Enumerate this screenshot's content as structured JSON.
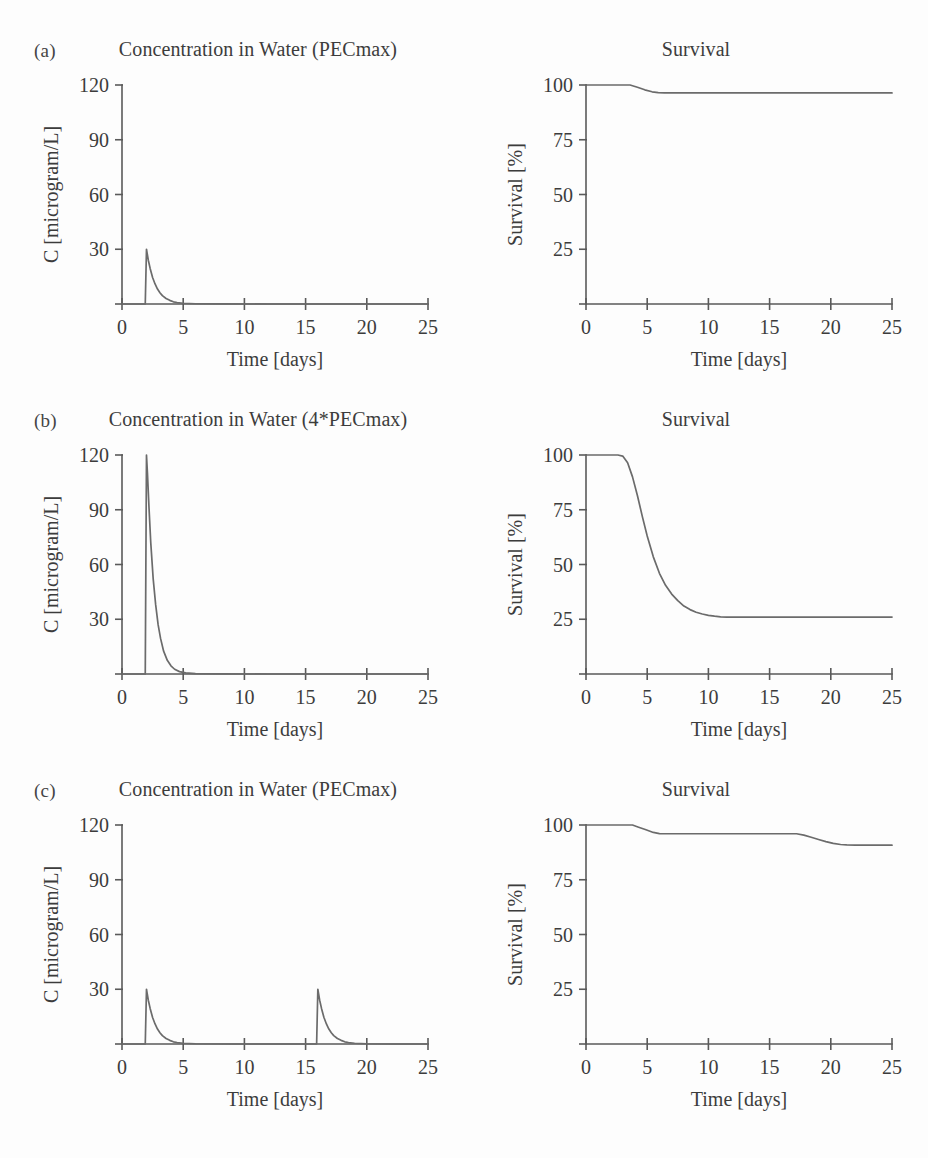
{
  "figure": {
    "background": "#fdfdfd",
    "curve_color": "#6b6b6b",
    "axis_color": "#5a5a5a",
    "text_color": "#3c3c3c"
  },
  "panels": [
    {
      "tag": "(a)",
      "left": {
        "title": "Concentration in Water (PECmax)",
        "xlabel": "Time [days]",
        "ylabel": "C [microgram/L]"
      },
      "right": {
        "title": "Survival",
        "xlabel": "Time [days]",
        "ylabel": "Survival [%]"
      }
    },
    {
      "tag": "(b)",
      "left": {
        "title": "Concentration in Water (4*PECmax)",
        "xlabel": "Time [days]",
        "ylabel": "C [microgram/L]"
      },
      "right": {
        "title": "Survival",
        "xlabel": "Time [days]",
        "ylabel": "Survival [%]"
      }
    },
    {
      "tag": "(c)",
      "left": {
        "title": "Concentration in Water (PECmax)",
        "xlabel": "Time [days]",
        "ylabel": "C [microgram/L]"
      },
      "right": {
        "title": "Survival",
        "xlabel": "Time [days]",
        "ylabel": "Survival [%]"
      }
    }
  ],
  "chart_data": [
    {
      "id": "a-concentration",
      "panel": "(a)",
      "type": "line",
      "title": "Concentration in Water (PECmax)",
      "xlabel": "Time [days]",
      "ylabel": "C [microgram/L]",
      "xlim": [
        0,
        25
      ],
      "ylim": [
        0,
        120
      ],
      "xticks": [
        0,
        5,
        10,
        15,
        20,
        25
      ],
      "yticks": [
        0,
        30,
        60,
        90,
        120
      ],
      "ytick_labels": [
        "",
        "30",
        "60",
        "90",
        "120"
      ],
      "grid": false,
      "legend": "none",
      "series": [
        {
          "name": "PECmax pulse",
          "x": [
            0,
            1.0,
            1.9,
            2.0,
            2.05,
            2.15,
            2.3,
            2.5,
            2.7,
            2.9,
            3.1,
            3.3,
            3.6,
            3.9,
            4.2,
            4.5,
            5.0,
            6.0,
            8.0,
            12.0,
            18.0,
            25.0
          ],
          "y": [
            0,
            0,
            0,
            30.0,
            28.0,
            24.0,
            19.5,
            14.5,
            11.0,
            8.2,
            6.2,
            4.6,
            3.0,
            2.0,
            1.2,
            0.8,
            0.4,
            0.15,
            0.05,
            0.0,
            0.0,
            0.0
          ]
        }
      ]
    },
    {
      "id": "a-survival",
      "panel": "(a)",
      "type": "line",
      "title": "Survival",
      "xlabel": "Time [days]",
      "ylabel": "Survival [%]",
      "xlim": [
        0,
        25
      ],
      "ylim": [
        0,
        100
      ],
      "xticks": [
        0,
        5,
        10,
        15,
        20,
        25
      ],
      "yticks": [
        0,
        25,
        50,
        75,
        100
      ],
      "ytick_labels": [
        "",
        "25",
        "50",
        "75",
        "100"
      ],
      "grid": false,
      "legend": "none",
      "series": [
        {
          "name": "Survival",
          "x": [
            0,
            2.0,
            3.6,
            4.2,
            4.8,
            5.4,
            5.9,
            6.4,
            8.0,
            12.0,
            18.0,
            25.0
          ],
          "y": [
            100,
            100,
            100,
            99.0,
            97.8,
            96.9,
            96.5,
            96.4,
            96.4,
            96.4,
            96.4,
            96.4
          ]
        }
      ]
    },
    {
      "id": "b-concentration",
      "panel": "(b)",
      "type": "line",
      "title": "Concentration in Water (4*PECmax)",
      "xlabel": "Time [days]",
      "ylabel": "C [microgram/L]",
      "xlim": [
        0,
        25
      ],
      "ylim": [
        0,
        120
      ],
      "xticks": [
        0,
        5,
        10,
        15,
        20,
        25
      ],
      "yticks": [
        0,
        30,
        60,
        90,
        120
      ],
      "ytick_labels": [
        "",
        "30",
        "60",
        "90",
        "120"
      ],
      "grid": false,
      "legend": "none",
      "series": [
        {
          "name": "4*PECmax pulse",
          "x": [
            0,
            1.0,
            1.9,
            2.0,
            2.08,
            2.2,
            2.35,
            2.55,
            2.75,
            2.95,
            3.15,
            3.4,
            3.7,
            4.0,
            4.3,
            4.7,
            5.2,
            6.0,
            8.0,
            12.0,
            18.0,
            25.0
          ],
          "y": [
            0,
            0,
            0,
            120.0,
            110.0,
            92.0,
            72.0,
            52.0,
            38.0,
            27.0,
            19.5,
            12.5,
            7.5,
            4.5,
            2.6,
            1.3,
            0.6,
            0.2,
            0.05,
            0.0,
            0.0,
            0.0
          ]
        }
      ]
    },
    {
      "id": "b-survival",
      "panel": "(b)",
      "type": "line",
      "title": "Survival",
      "xlabel": "Time [days]",
      "ylabel": "Survival [%]",
      "xlim": [
        0,
        25
      ],
      "ylim": [
        0,
        100
      ],
      "xticks": [
        0,
        5,
        10,
        15,
        20,
        25
      ],
      "yticks": [
        0,
        25,
        50,
        75,
        100
      ],
      "ytick_labels": [
        "",
        "25",
        "50",
        "75",
        "100"
      ],
      "grid": false,
      "legend": "none",
      "series": [
        {
          "name": "Survival",
          "x": [
            0,
            1.5,
            2.6,
            3.0,
            3.4,
            3.8,
            4.2,
            4.6,
            5.0,
            5.5,
            6.0,
            6.5,
            7.0,
            7.5,
            8.0,
            8.5,
            9.0,
            9.5,
            10.0,
            10.5,
            11.0,
            11.5,
            12.5,
            15.0,
            20.0,
            25.0
          ],
          "y": [
            100,
            100,
            100,
            99.5,
            96.5,
            90.0,
            81.5,
            72.0,
            63.0,
            53.5,
            46.0,
            40.5,
            36.5,
            33.5,
            31.0,
            29.4,
            28.2,
            27.4,
            26.8,
            26.4,
            26.1,
            26.0,
            26.0,
            26.0,
            26.0,
            26.0
          ]
        }
      ]
    },
    {
      "id": "c-concentration",
      "panel": "(c)",
      "type": "line",
      "title": "Concentration in Water (PECmax)",
      "xlabel": "Time [days]",
      "ylabel": "C [microgram/L]",
      "xlim": [
        0,
        25
      ],
      "ylim": [
        0,
        120
      ],
      "xticks": [
        0,
        5,
        10,
        15,
        20,
        25
      ],
      "yticks": [
        0,
        30,
        60,
        90,
        120
      ],
      "ytick_labels": [
        "",
        "30",
        "60",
        "90",
        "120"
      ],
      "grid": false,
      "legend": "none",
      "series": [
        {
          "name": "PECmax pulse 1 and 2",
          "x": [
            0,
            1.0,
            1.9,
            2.0,
            2.05,
            2.15,
            2.3,
            2.5,
            2.7,
            2.9,
            3.1,
            3.3,
            3.6,
            3.9,
            4.2,
            4.5,
            5.0,
            6.0,
            9.0,
            13.0,
            15.9,
            16.0,
            16.05,
            16.15,
            16.3,
            16.5,
            16.7,
            16.9,
            17.1,
            17.3,
            17.6,
            17.9,
            18.2,
            18.5,
            19.0,
            20.0,
            22.0,
            25.0
          ],
          "y": [
            0,
            0,
            0,
            30.0,
            28.0,
            24.0,
            19.5,
            14.5,
            11.0,
            8.2,
            6.2,
            4.6,
            3.0,
            2.0,
            1.2,
            0.8,
            0.4,
            0.15,
            0.0,
            0.0,
            0.0,
            30.0,
            28.0,
            24.0,
            19.5,
            14.5,
            11.0,
            8.2,
            6.2,
            4.6,
            3.0,
            2.0,
            1.2,
            0.8,
            0.4,
            0.15,
            0.0,
            0.0
          ]
        }
      ]
    },
    {
      "id": "c-survival",
      "panel": "(c)",
      "type": "line",
      "title": "Survival",
      "xlabel": "Time [days]",
      "ylabel": "Survival [%]",
      "xlim": [
        0,
        25
      ],
      "ylim": [
        0,
        100
      ],
      "xticks": [
        0,
        5,
        10,
        15,
        20,
        25
      ],
      "yticks": [
        0,
        25,
        50,
        75,
        100
      ],
      "ytick_labels": [
        "",
        "25",
        "50",
        "75",
        "100"
      ],
      "grid": false,
      "legend": "none",
      "series": [
        {
          "name": "Survival",
          "x": [
            0,
            2.0,
            3.8,
            4.3,
            4.9,
            5.5,
            6.0,
            6.5,
            10.0,
            14.0,
            17.2,
            17.8,
            18.4,
            19.0,
            19.6,
            20.2,
            20.8,
            21.3,
            22.0,
            25.0
          ],
          "y": [
            100,
            100,
            100,
            99.0,
            97.8,
            96.6,
            96.1,
            96.0,
            96.0,
            96.0,
            96.0,
            95.4,
            94.4,
            93.4,
            92.4,
            91.6,
            91.1,
            90.9,
            90.8,
            90.8
          ]
        }
      ]
    }
  ]
}
